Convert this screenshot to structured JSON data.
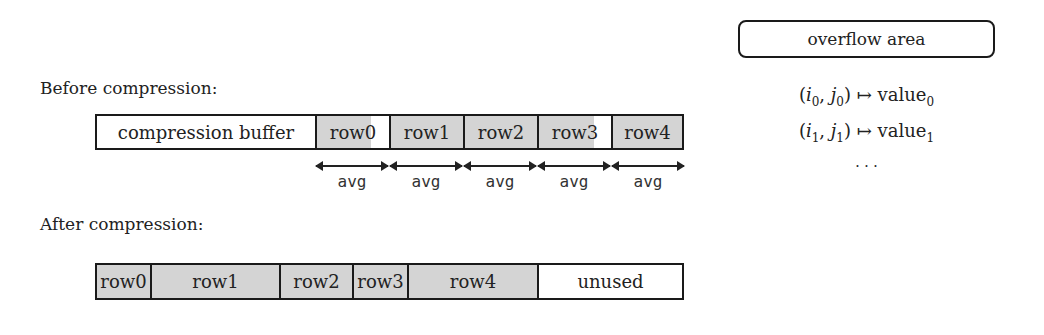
{
  "before": {
    "heading": "Before compression:",
    "cells": [
      {
        "label": "compression buffer",
        "x": 95,
        "w": 220,
        "fill_pct": 0
      },
      {
        "label": "row0",
        "x": 315,
        "w": 74,
        "fill_pct": 75
      },
      {
        "label": "row1",
        "x": 389,
        "w": 74,
        "fill_pct": 100
      },
      {
        "label": "row2",
        "x": 463,
        "w": 74,
        "fill_pct": 100
      },
      {
        "label": "row3",
        "x": 537,
        "w": 74,
        "fill_pct": 76
      },
      {
        "label": "row4",
        "x": 611,
        "w": 73,
        "fill_pct": 100
      }
    ],
    "arrow_label": "avg",
    "arrows": [
      "avg",
      "avg",
      "avg",
      "avg",
      "avg"
    ]
  },
  "after": {
    "heading": "After compression:",
    "cells": [
      {
        "label": "row0",
        "x": 95,
        "w": 55,
        "fill_pct": 100
      },
      {
        "label": "row1",
        "x": 150,
        "w": 129,
        "fill_pct": 100
      },
      {
        "label": "row2",
        "x": 279,
        "w": 73,
        "fill_pct": 100
      },
      {
        "label": "row3",
        "x": 352,
        "w": 55,
        "fill_pct": 100
      },
      {
        "label": "row4",
        "x": 407,
        "w": 130,
        "fill_pct": 100
      },
      {
        "label": "unused",
        "x": 537,
        "w": 147,
        "fill_pct": 0
      }
    ]
  },
  "overflow": {
    "title": "overflow area",
    "entries": [
      {
        "key_i": "i",
        "key_i_sub": "0",
        "key_j": "j",
        "key_j_sub": "0",
        "arrow": "↦",
        "value": "value",
        "value_sub": "0"
      },
      {
        "key_i": "i",
        "key_i_sub": "1",
        "key_j": "j",
        "key_j_sub": "1",
        "arrow": "↦",
        "value": "value",
        "value_sub": "1"
      }
    ],
    "ellipsis": "· · ·"
  },
  "colors": {
    "fill": "#d4d4d4",
    "border": "#1a1a1a",
    "background": "#ffffff"
  }
}
